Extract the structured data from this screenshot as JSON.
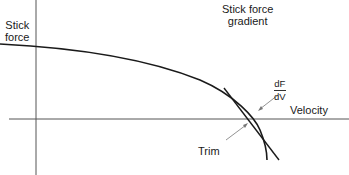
{
  "diagram": {
    "title": "Stick force gradient",
    "y_axis_label_line1": "Stick",
    "y_axis_label_line2": "force",
    "x_axis_label": "Velocity",
    "gradient_label_line1": "Stick force",
    "gradient_label_line2": "gradient",
    "derivative_numerator": "dF",
    "derivative_denominator": "dV",
    "trim_label": "Trim",
    "line_color": "#1a1a1a",
    "axis_color": "#555555"
  }
}
